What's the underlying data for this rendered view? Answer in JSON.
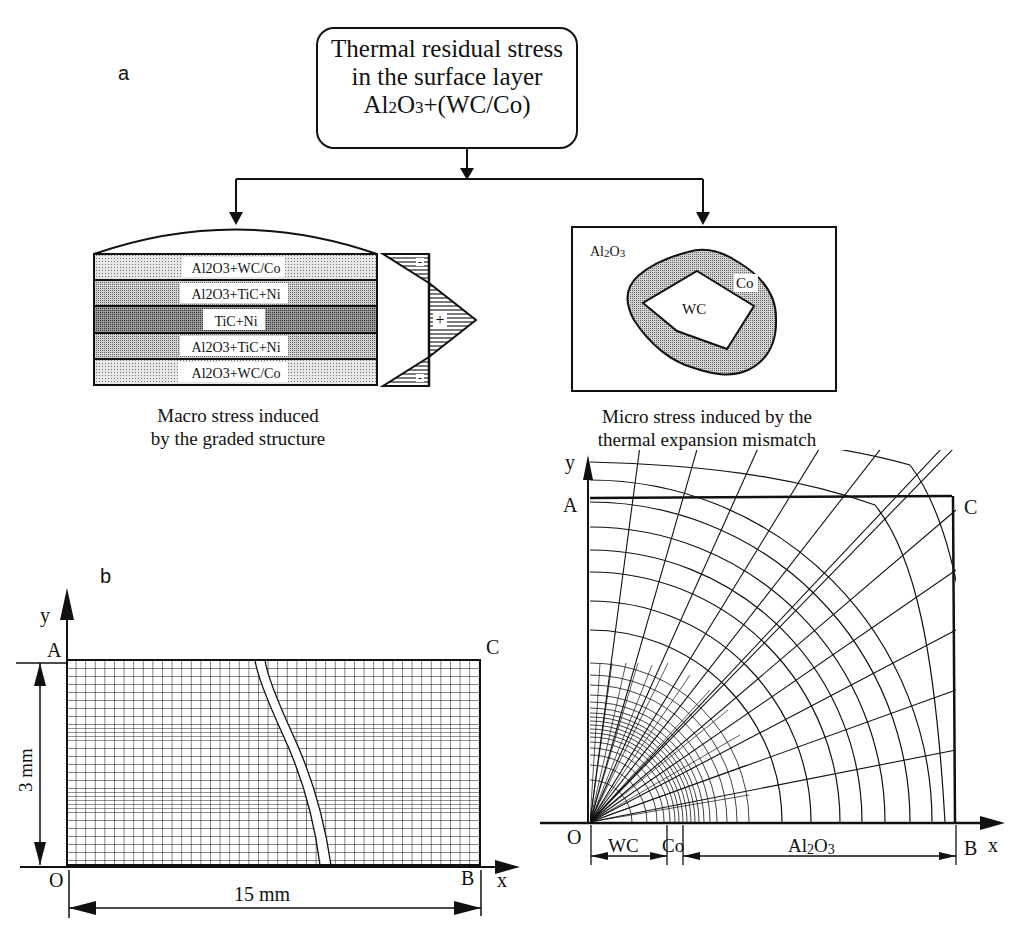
{
  "figure": {
    "panel_a": {
      "letter": "a",
      "title_lines": [
        "Thermal residual stress",
        "in the surface layer",
        "Al2O3+(WC/Co)"
      ],
      "macro": {
        "layers": [
          "Al2O3+WC/Co",
          "Al2O3+TiC+Ni",
          "TiC+Ni",
          "Al2O3+TiC+Ni",
          "Al2O3+WC/Co"
        ],
        "stress_signs": [
          "-",
          "+",
          "-"
        ],
        "caption_lines": [
          "Macro stress induced",
          "by the graded structure"
        ]
      },
      "micro": {
        "matrix_label": "Al2O3",
        "binder_label": "Co",
        "particle_label": "WC",
        "caption_lines": [
          "Micro stress induced by the",
          "thermal expansion mismatch"
        ]
      }
    },
    "panel_b": {
      "letter": "b",
      "axis_x": "x",
      "axis_y": "y",
      "corners": {
        "A": "A",
        "B": "B",
        "C": "C",
        "O": "O"
      },
      "height_dim": "3 mm",
      "width_dim": "15 mm"
    },
    "panel_c": {
      "letter": "c",
      "axis_x": "x",
      "axis_y": "y",
      "corners": {
        "A": "A",
        "B": "B",
        "C": "C",
        "O": "O"
      },
      "dims": [
        "WC",
        "Co",
        "Al2O3"
      ]
    }
  },
  "colors": {
    "ink": "#111111",
    "background": "#ffffff",
    "stipple_light": "#cfcfcf",
    "stipple_dark": "#8a8a8a"
  }
}
